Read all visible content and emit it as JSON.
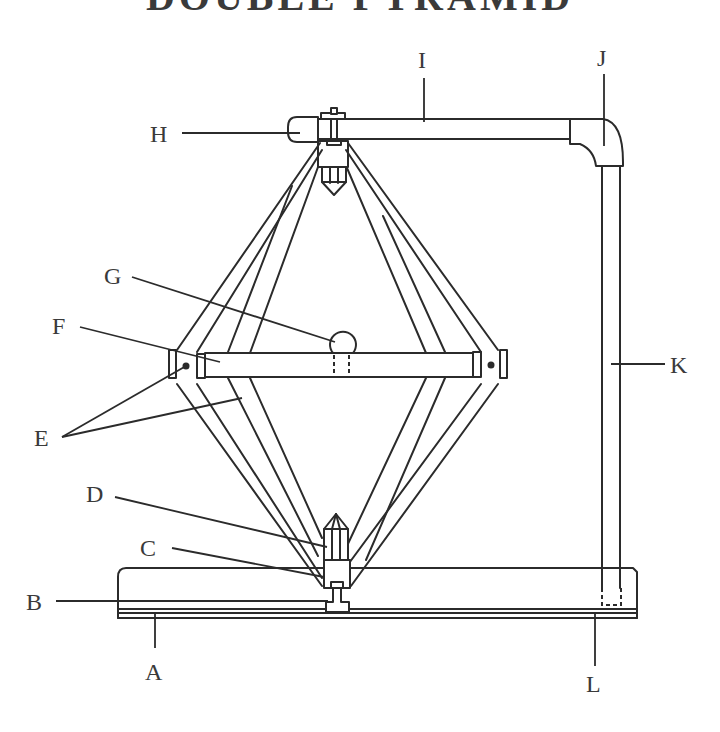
{
  "title": "DOUBLE PYRAMID",
  "colors": {
    "line": "#2b2b2b",
    "text": "#3a3a3a",
    "background": "#ffffff"
  },
  "labels": {
    "A": "A",
    "B": "B",
    "C": "C",
    "D": "D",
    "E": "E",
    "F": "F",
    "G": "G",
    "H": "H",
    "I": "I",
    "J": "J",
    "K": "K",
    "L": "L"
  },
  "parts": [
    {
      "label": "A",
      "description": "base board"
    },
    {
      "label": "B",
      "description": "bottom bolt through base"
    },
    {
      "label": "C",
      "description": "lower holder block"
    },
    {
      "label": "D",
      "description": "lower crystal point"
    },
    {
      "label": "E",
      "description": "pyramid struts with pivot pins"
    },
    {
      "label": "F",
      "description": "horizontal crossbar"
    },
    {
      "label": "G",
      "description": "sphere on crossbar"
    },
    {
      "label": "H",
      "description": "pipe end cap"
    },
    {
      "label": "I",
      "description": "horizontal top pipe"
    },
    {
      "label": "J",
      "description": "elbow joint"
    },
    {
      "label": "K",
      "description": "vertical support pipe"
    },
    {
      "label": "L",
      "description": "pipe socket in base"
    }
  ]
}
